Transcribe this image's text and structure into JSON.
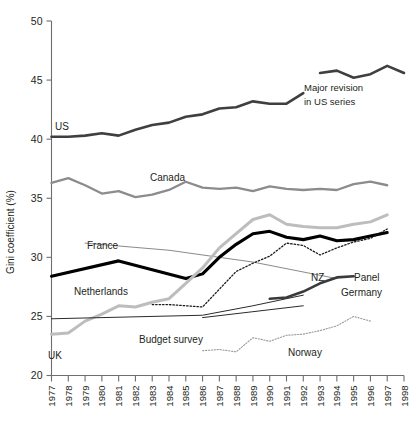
{
  "chart_data": {
    "type": "line",
    "title": "",
    "xlabel": "",
    "ylabel": "Gini coefficient (%)",
    "ylim": [
      20,
      50
    ],
    "yticks": [
      20,
      25,
      30,
      35,
      40,
      45,
      50
    ],
    "ytick_labels": [
      "20",
      "25",
      "30",
      "35",
      "40",
      "45",
      "50"
    ],
    "grid": false,
    "legend": "inline-labels",
    "x": [
      1977,
      1978,
      1979,
      1980,
      1981,
      1982,
      1983,
      1984,
      1985,
      1986,
      1987,
      1988,
      1989,
      1990,
      1991,
      1992,
      1993,
      1994,
      1995,
      1996,
      1997,
      1998
    ],
    "xtick_labels": [
      "1977",
      "1978",
      "1979",
      "1980",
      "1981",
      "1982",
      "1983",
      "1984",
      "1985",
      "1986",
      "1987",
      "1988",
      "1989",
      "1990",
      "1991",
      "1992",
      "1993",
      "1994",
      "1995",
      "1996",
      "1997",
      "1998"
    ],
    "series": [
      {
        "name": "US",
        "label": "US",
        "color": "#3f3f3f",
        "width": 2.6,
        "style": "solid",
        "x": [
          1977,
          1978,
          1979,
          1980,
          1981,
          1982,
          1983,
          1984,
          1985,
          1986,
          1987,
          1988,
          1989,
          1990,
          1991,
          1992
        ],
        "values": [
          40.2,
          40.2,
          40.3,
          40.5,
          40.3,
          40.8,
          41.2,
          41.4,
          41.9,
          42.1,
          42.6,
          42.7,
          43.2,
          43.0,
          43.0,
          43.9
        ]
      },
      {
        "name": "US-revised",
        "label": "",
        "color": "#3f3f3f",
        "width": 2.6,
        "style": "solid",
        "x": [
          1993,
          1994,
          1995,
          1996,
          1997,
          1998
        ],
        "values": [
          45.6,
          45.8,
          45.2,
          45.5,
          46.2,
          45.6
        ]
      },
      {
        "name": "Canada",
        "label": "Canada",
        "color": "#8c8c8c",
        "width": 2.3,
        "style": "solid",
        "x": [
          1977,
          1978,
          1979,
          1980,
          1981,
          1982,
          1983,
          1984,
          1985,
          1986,
          1987,
          1988,
          1989,
          1990,
          1991,
          1992,
          1993,
          1994,
          1995,
          1996,
          1997
        ],
        "values": [
          36.3,
          36.7,
          36.1,
          35.4,
          35.6,
          35.1,
          35.3,
          35.7,
          36.4,
          35.9,
          35.8,
          35.9,
          35.6,
          36.0,
          35.8,
          35.7,
          35.8,
          35.7,
          36.2,
          36.4,
          36.1
        ]
      },
      {
        "name": "France",
        "label": "France",
        "color": "#8a8a8a",
        "width": 1.0,
        "style": "solid",
        "x": [
          1979,
          1984,
          1989,
          1994
        ],
        "values": [
          31.2,
          30.6,
          29.6,
          28.2
        ]
      },
      {
        "name": "Netherlands",
        "label": "Netherlands",
        "color": "#000000",
        "width": 3.1,
        "style": "solid",
        "x": [
          1977,
          1981,
          1985,
          1986,
          1987,
          1988,
          1989,
          1990,
          1991,
          1992,
          1993,
          1994,
          1995,
          1996,
          1997
        ],
        "values": [
          28.4,
          29.7,
          28.2,
          28.6,
          30.0,
          31.1,
          32.0,
          32.2,
          31.7,
          31.5,
          31.8,
          31.4,
          31.5,
          31.8,
          32.1
        ]
      },
      {
        "name": "UK",
        "label": "UK",
        "color": "#bdbdbd",
        "width": 3.0,
        "style": "solid",
        "x": [
          1977,
          1978,
          1979,
          1980,
          1981,
          1982,
          1983,
          1984,
          1985,
          1986,
          1987,
          1988,
          1989,
          1990,
          1991,
          1992,
          1993,
          1994,
          1995,
          1996,
          1997
        ],
        "values": [
          23.5,
          23.6,
          24.6,
          25.2,
          25.9,
          25.8,
          26.2,
          26.5,
          27.8,
          29.1,
          30.8,
          32.0,
          33.2,
          33.6,
          32.8,
          32.6,
          32.5,
          32.5,
          32.8,
          33.0,
          33.6
        ]
      },
      {
        "name": "Budget survey",
        "label": "Budget survey",
        "color": "#2b2b2b",
        "width": 1.0,
        "style": "solid",
        "x": [
          1977,
          1986,
          1989,
          1992
        ],
        "values": [
          24.8,
          25.1,
          25.9,
          26.8
        ]
      },
      {
        "name": "NZ",
        "label": "NZ",
        "color": "#1a1a1a",
        "width": 1.3,
        "style": "dotted",
        "x": [
          1983,
          1984,
          1985,
          1986,
          1987,
          1988,
          1989,
          1990,
          1991,
          1992,
          1993,
          1994,
          1995,
          1996,
          1997
        ],
        "values": [
          26.0,
          26.0,
          25.9,
          25.8,
          27.3,
          28.8,
          29.5,
          30.1,
          31.2,
          31.0,
          30.2,
          30.8,
          31.3,
          31.6,
          32.4
        ]
      },
      {
        "name": "Panel Germany",
        "label": "Panel Germany",
        "color": "#3a3a3a",
        "width": 2.6,
        "style": "solid",
        "x": [
          1990,
          1991,
          1992,
          1993,
          1994,
          1995
        ],
        "values": [
          26.5,
          26.6,
          27.1,
          27.8,
          28.3,
          28.4
        ]
      },
      {
        "name": "Germany budget",
        "label": "",
        "color": "#2b2b2b",
        "width": 1.0,
        "style": "solid",
        "x": [
          1986,
          1989,
          1992
        ],
        "values": [
          24.9,
          25.4,
          25.9
        ]
      },
      {
        "name": "Norway",
        "label": "Norway",
        "color": "#9a9a9a",
        "width": 1.1,
        "style": "dotted",
        "x": [
          1986,
          1987,
          1988,
          1989,
          1990,
          1991,
          1992,
          1993,
          1994,
          1995,
          1996
        ],
        "values": [
          22.1,
          22.2,
          22.0,
          23.2,
          22.9,
          23.4,
          23.5,
          23.8,
          24.2,
          25.0,
          24.6
        ]
      }
    ],
    "annotations": [
      {
        "name": "major-revision-note",
        "text_line1": "Major revision",
        "text_line2": "in US series"
      }
    ]
  },
  "labels": {
    "us": "US",
    "canada": "Canada",
    "france": "France",
    "netherlands": "Netherlands",
    "uk": "UK",
    "budget_survey": "Budget survey",
    "nz": "NZ",
    "panel": "Panel",
    "germany": "Germany",
    "norway": "Norway"
  },
  "annotation": {
    "line1": "Major revision",
    "line2": "in US series"
  },
  "axis": {
    "ylabel": "Gini coefficient (%)"
  }
}
